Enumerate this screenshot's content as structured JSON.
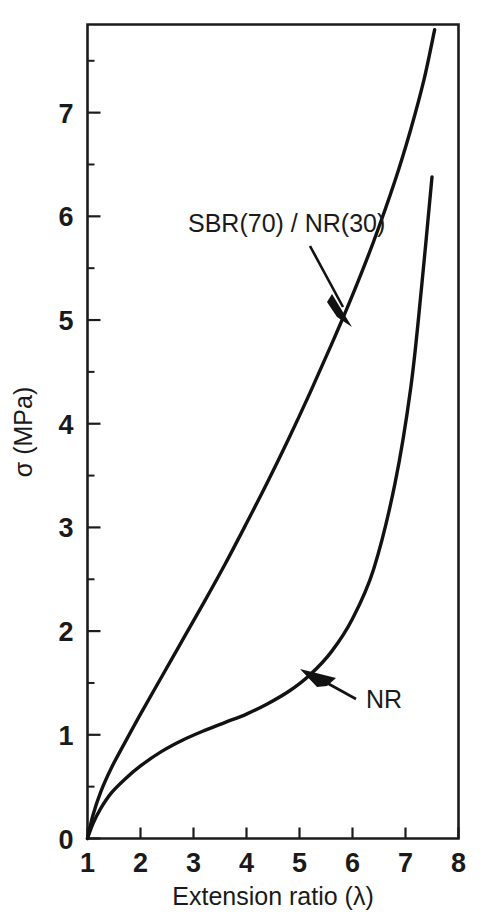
{
  "chart_data": {
    "type": "line",
    "title": "",
    "xlabel": "Extension ratio  (λ)",
    "ylabel": "σ (MPa)",
    "xlim": [
      1,
      8
    ],
    "ylim": [
      0,
      7.85
    ],
    "grid": false,
    "legend_position": "inline-annotations",
    "x_ticks": [
      "1",
      "2",
      "3",
      "4",
      "5",
      "6",
      "7",
      "8"
    ],
    "x_tick_values": [
      1,
      2,
      3,
      4,
      5,
      6,
      7,
      8
    ],
    "y_ticks": [
      "0",
      "1",
      "2",
      "3",
      "4",
      "5",
      "6",
      "7"
    ],
    "y_tick_values": [
      0,
      1,
      2,
      3,
      4,
      5,
      6,
      7
    ],
    "x_minor_ticks": [],
    "y_minor_ticks": [
      0.5,
      1.5,
      2.5,
      3.5,
      4.5,
      5.5,
      6.5,
      7.5
    ],
    "series": [
      {
        "name": "SBR(70) / NR(30)",
        "label_text": "SBR(70) / NR(30)",
        "color": "#121212",
        "x": [
          1.0,
          1.1,
          1.25,
          1.45,
          1.7,
          2.0,
          2.4,
          2.8,
          3.2,
          3.6,
          4.0,
          4.4,
          4.8,
          5.2,
          5.6,
          6.0,
          6.4,
          6.8,
          7.1,
          7.35,
          7.55
        ],
        "y": [
          0.0,
          0.22,
          0.45,
          0.68,
          0.92,
          1.2,
          1.56,
          1.92,
          2.28,
          2.65,
          3.04,
          3.44,
          3.86,
          4.3,
          4.76,
          5.24,
          5.76,
          6.34,
          6.84,
          7.32,
          7.8
        ]
      },
      {
        "name": "NR",
        "label_text": "NR",
        "color": "#121212",
        "x": [
          1.0,
          1.1,
          1.25,
          1.45,
          1.7,
          2.0,
          2.4,
          2.8,
          3.2,
          3.6,
          4.0,
          4.4,
          4.8,
          5.2,
          5.6,
          6.0,
          6.4,
          6.8,
          7.1,
          7.3,
          7.5
        ],
        "y": [
          0.0,
          0.14,
          0.29,
          0.44,
          0.57,
          0.7,
          0.84,
          0.95,
          1.04,
          1.12,
          1.2,
          1.3,
          1.42,
          1.58,
          1.8,
          2.12,
          2.6,
          3.42,
          4.35,
          5.3,
          6.38
        ]
      }
    ],
    "annotations": [
      {
        "name": "sbr-annotation",
        "text": "SBR(70) / NR(30)",
        "points_to_series": "SBR(70) / NR(30)"
      },
      {
        "name": "nr-annotation",
        "text": "NR",
        "points_to_series": "NR"
      }
    ]
  },
  "axes": {
    "x_title": "Extension ratio  (λ)",
    "y_title": "σ (MPa)"
  },
  "ticks": {
    "x": [
      "1",
      "2",
      "3",
      "4",
      "5",
      "6",
      "7",
      "8"
    ],
    "y": [
      "0",
      "1",
      "2",
      "3",
      "4",
      "5",
      "6",
      "7"
    ]
  },
  "labels": {
    "sbr": "SBR(70) / NR(30)",
    "nr": "NR"
  },
  "colors": {
    "curve": "#121212",
    "axis": "#1c1c1c",
    "background": "#ffffff"
  }
}
